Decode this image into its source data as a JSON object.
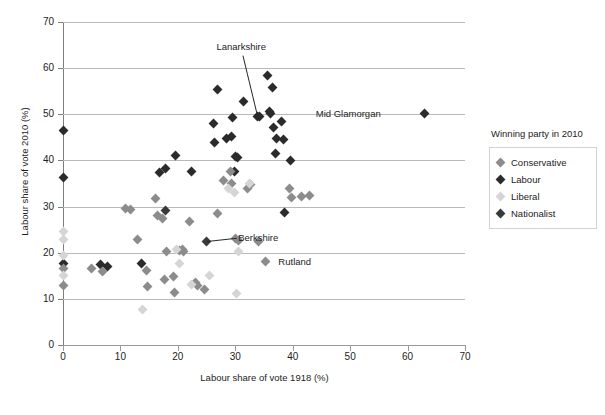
{
  "chart_data": {
    "type": "scatter",
    "title": "",
    "xlabel": "Labour share of vote 1918 (%)",
    "ylabel": "Labour share of vote 2010 (%)",
    "xlim": [
      0,
      70
    ],
    "ylim": [
      0,
      70
    ],
    "xticks": [
      0,
      10,
      20,
      30,
      40,
      50,
      60,
      70
    ],
    "yticks": [
      0,
      10,
      20,
      30,
      40,
      50,
      60,
      70
    ],
    "grid": "horizontal",
    "legend": {
      "title": "Winning party in 2010",
      "position": "right",
      "entries": [
        {
          "name": "Conservative",
          "color": "#8c8c8c"
        },
        {
          "name": "Labour",
          "color": "#2b2b2b"
        },
        {
          "name": "Liberal",
          "color": "#d5d5d5"
        },
        {
          "name": "Nationalist",
          "color": "#3a3a3a"
        }
      ]
    },
    "annotations": [
      {
        "text": "Lanarkshire",
        "x": 33.8,
        "y": 49.6,
        "label_x": 30.2,
        "label_y": 64.5,
        "leader": true
      },
      {
        "text": "Mid Glamorgan",
        "x": 63.0,
        "y": 50.1,
        "label_x": 47.5,
        "label_y": 50.1,
        "leader": false
      },
      {
        "text": "Berkshire",
        "x": 25.0,
        "y": 22.5,
        "label_x": 30.5,
        "label_y": 23.2,
        "leader": true
      },
      {
        "text": "Rutland",
        "x": 35.2,
        "y": 18.0,
        "label_x": 37.5,
        "label_y": 18.0,
        "leader": false
      }
    ],
    "series": [
      {
        "name": "Labour",
        "color": "#2b2b2b",
        "points": [
          [
            0.0,
            46.5
          ],
          [
            0.0,
            36.4
          ],
          [
            0.0,
            17.6
          ],
          [
            6.6,
            17.4
          ],
          [
            7.7,
            17.1
          ],
          [
            13.6,
            17.7
          ],
          [
            16.8,
            37.4
          ],
          [
            17.8,
            38.3
          ],
          [
            19.6,
            41.1
          ],
          [
            22.3,
            37.5
          ],
          [
            26.2,
            48.1
          ],
          [
            26.3,
            43.9
          ],
          [
            26.9,
            55.3
          ],
          [
            28.4,
            44.8
          ],
          [
            29.3,
            45.2
          ],
          [
            29.6,
            49.2
          ],
          [
            29.8,
            37.5
          ],
          [
            30.0,
            40.9
          ],
          [
            30.3,
            40.7
          ],
          [
            31.5,
            52.8
          ],
          [
            33.8,
            49.6
          ],
          [
            34.2,
            49.5
          ],
          [
            35.6,
            58.3
          ],
          [
            35.9,
            50.6
          ],
          [
            36.1,
            50.1
          ],
          [
            36.4,
            55.7
          ],
          [
            36.6,
            47.1
          ],
          [
            37.0,
            41.4
          ],
          [
            37.2,
            44.8
          ],
          [
            38.1,
            48.5
          ],
          [
            38.4,
            44.6
          ],
          [
            38.6,
            28.7
          ],
          [
            39.6,
            40.0
          ],
          [
            63.0,
            50.1
          ]
        ]
      },
      {
        "name": "Conservative",
        "color": "#8c8c8c",
        "points": [
          [
            0.0,
            16.6
          ],
          [
            0.0,
            13.0
          ],
          [
            5.0,
            16.5
          ],
          [
            6.9,
            16.0
          ],
          [
            10.8,
            29.5
          ],
          [
            11.7,
            29.4
          ],
          [
            12.9,
            22.9
          ],
          [
            14.6,
            16.1
          ],
          [
            14.8,
            12.7
          ],
          [
            16.1,
            31.7
          ],
          [
            16.4,
            28.0
          ],
          [
            17.3,
            27.5
          ],
          [
            17.7,
            14.3
          ],
          [
            18.0,
            20.2
          ],
          [
            19.3,
            14.9
          ],
          [
            19.5,
            11.4
          ],
          [
            20.2,
            20.4
          ],
          [
            20.8,
            20.7
          ],
          [
            21.0,
            20.2
          ],
          [
            22.0,
            26.7
          ],
          [
            23.1,
            13.5
          ],
          [
            23.4,
            12.9
          ],
          [
            24.6,
            12.0
          ],
          [
            26.9,
            28.4
          ],
          [
            28.0,
            35.6
          ],
          [
            29.2,
            37.7
          ],
          [
            29.4,
            35.0
          ],
          [
            30.1,
            23.0
          ],
          [
            30.6,
            22.6
          ],
          [
            32.2,
            34.0
          ],
          [
            32.6,
            34.7
          ],
          [
            34.0,
            22.4
          ],
          [
            35.2,
            18.0
          ],
          [
            39.4,
            33.9
          ],
          [
            39.8,
            31.9
          ],
          [
            41.6,
            32.2
          ],
          [
            43.0,
            32.3
          ]
        ]
      },
      {
        "name": "Liberal",
        "color": "#d5d5d5",
        "points": [
          [
            0.0,
            24.5
          ],
          [
            0.0,
            22.8
          ],
          [
            0.0,
            19.3
          ],
          [
            0.0,
            15.0
          ],
          [
            13.9,
            7.7
          ],
          [
            19.8,
            20.6
          ],
          [
            20.3,
            17.6
          ],
          [
            22.4,
            13.1
          ],
          [
            25.5,
            15.1
          ],
          [
            28.9,
            34.0
          ],
          [
            29.9,
            33.0
          ],
          [
            30.2,
            11.2
          ],
          [
            30.5,
            20.3
          ],
          [
            32.4,
            35.0
          ]
        ]
      },
      {
        "name": "Nationalist",
        "color": "#3a3a3a",
        "points": [
          [
            17.9,
            29.2
          ],
          [
            25.0,
            22.5
          ]
        ]
      }
    ]
  }
}
